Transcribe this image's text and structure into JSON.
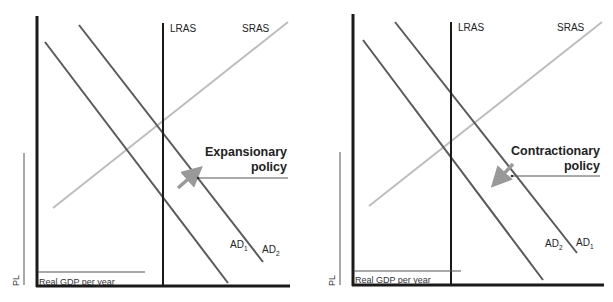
{
  "colors": {
    "axis": "#1a1a1a",
    "lras": "#1a1a1a",
    "sras": "#b8b8b8",
    "ad": "#555555",
    "arrow": "#999999",
    "pointer": "#444444"
  },
  "left_diagram": {
    "lras_label": "LRAS",
    "sras_label": "SRAS",
    "policy_line1": "Expansionary",
    "policy_line2": "policy",
    "ad_upper_label": "AD",
    "ad_upper_sub": "2",
    "ad_lower_label": "AD",
    "ad_lower_sub": "1",
    "y_axis_label": "PL",
    "x_axis_label": "Real GDP per year",
    "shift_direction": "right"
  },
  "right_diagram": {
    "lras_label": "LRAS",
    "sras_label": "SRAS",
    "policy_line1": "Contractionary",
    "policy_line2": "policy",
    "ad_upper_label": "AD",
    "ad_upper_sub": "1",
    "ad_lower_label": "AD",
    "ad_lower_sub": "2",
    "y_axis_label": "PL",
    "x_axis_label": "Real GDP per year",
    "shift_direction": "left"
  }
}
